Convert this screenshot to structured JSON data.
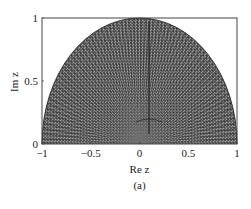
{
  "figure": {
    "caption": "(a)"
  },
  "chart_data": {
    "type": "heatmap",
    "title": "",
    "region": "upper half unit disk |z| <= 1, Im z >= 0",
    "xlabel": "Re z",
    "ylabel": "Im z",
    "xlim": [
      -1,
      1
    ],
    "ylim": [
      0,
      1
    ],
    "xticks": [
      -1,
      -0.5,
      0,
      0.5,
      1
    ],
    "xtick_labels": [
      "−1",
      "−0.5",
      "0",
      "0.5",
      "1"
    ],
    "yticks": [
      0,
      0.5,
      1
    ],
    "ytick_labels": [
      "0",
      "0.5",
      "1"
    ],
    "grid": false,
    "legend": null,
    "colormap": "grayscale",
    "features": [
      {
        "kind": "boundary",
        "shape": "semicircle",
        "center": [
          0,
          0
        ],
        "radius": 1
      },
      {
        "kind": "radial-rays",
        "origin": [
          0,
          0
        ],
        "note": "fine alternating light/dark rays fanning out from the origin"
      },
      {
        "kind": "vertical-line",
        "x": 0.05,
        "y_range": [
          0.1,
          1
        ],
        "note": "dark vertical line near Re z ≈ 0"
      },
      {
        "kind": "cusp",
        "location": [
          0.05,
          0.2
        ],
        "note": "branching pattern near the bottom center"
      }
    ]
  },
  "colors": {
    "background": "#ffffff",
    "axes": "#444444",
    "fill_dark": "#3a3a3a",
    "fill_mid": "#6e6e6e",
    "fill_light": "#b8b8b8",
    "text": "#222222"
  }
}
